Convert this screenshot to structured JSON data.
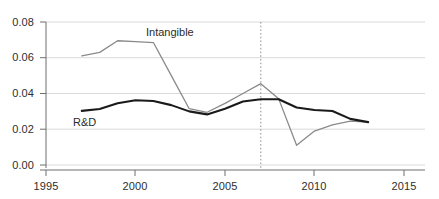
{
  "chart_data": {
    "type": "line",
    "title": "",
    "subtitle": "",
    "xlabel": "",
    "ylabel": "",
    "xlim": [
      1995,
      2015
    ],
    "ylim": [
      0.0,
      0.08
    ],
    "grid": true,
    "grid_axis": "y",
    "legend_position": "inline-annotation",
    "x_ticks": [
      "1995",
      "2000",
      "2005",
      "2010",
      "2015"
    ],
    "x_tick_values": [
      1995,
      2000,
      2005,
      2010,
      2015
    ],
    "y_ticks": [
      "0.00",
      "0.02",
      "0.04",
      "0.06",
      "0.08"
    ],
    "y_tick_values": [
      0.0,
      0.02,
      0.04,
      0.06,
      0.08
    ],
    "annotations": [
      {
        "name": "recession-marker",
        "type": "vline",
        "x": 2007,
        "style": "dotted",
        "color": "#8c8c8c"
      }
    ],
    "series": [
      {
        "name": "Intangible",
        "color": "#8a8a8a",
        "width": 1.3,
        "label": "Intangible",
        "x": [
          1997,
          1998,
          1999,
          2000,
          2001,
          2002,
          2003,
          2004,
          2005,
          2006,
          2007,
          2008,
          2009,
          2010,
          2011,
          2012,
          2013
        ],
        "values": [
          0.061,
          0.063,
          0.0695,
          0.069,
          0.0685,
          0.05,
          0.0315,
          0.0295,
          0.0345,
          0.04,
          0.0455,
          0.037,
          0.011,
          0.019,
          0.0225,
          0.0245,
          0.024
        ]
      },
      {
        "name": "R&D",
        "color": "#1a1a1a",
        "width": 2.1,
        "label": "R&D",
        "x": [
          1997,
          1998,
          1999,
          2000,
          2001,
          2002,
          2003,
          2004,
          2005,
          2006,
          2007,
          2008,
          2009,
          2010,
          2011,
          2012,
          2013
        ],
        "values": [
          0.0303,
          0.0313,
          0.0345,
          0.0362,
          0.0358,
          0.0335,
          0.03,
          0.0283,
          0.0315,
          0.0355,
          0.0368,
          0.0368,
          0.0322,
          0.0308,
          0.0302,
          0.0258,
          0.024
        ]
      }
    ]
  },
  "labels": {
    "intangible": "Intangible",
    "rnd": "R&D"
  },
  "axis": {
    "y_0": "0.00",
    "y_1": "0.02",
    "y_2": "0.04",
    "y_3": "0.06",
    "y_4": "0.08",
    "x_0": "1995",
    "x_1": "2000",
    "x_2": "2005",
    "x_3": "2010",
    "x_4": "2015"
  },
  "colors": {
    "intangible_line": "#8a8a8a",
    "rnd_line": "#1a1a1a",
    "gridline": "#d9d9d9",
    "axis": "#6f6f6f",
    "marker": "#8c8c8c",
    "background": "#ffffff"
  }
}
